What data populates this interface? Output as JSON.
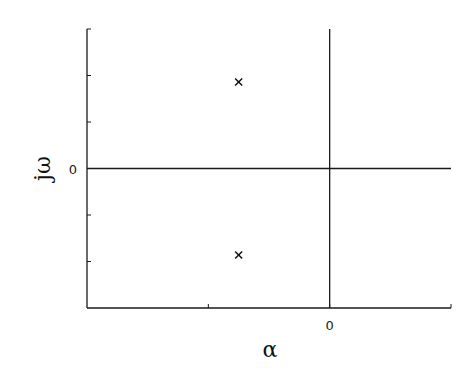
{
  "chart_data": {
    "type": "scatter",
    "title": "",
    "xlabel": "α",
    "ylabel": "jω",
    "xlim": [
      -2,
      1
    ],
    "ylim": [
      -1.5,
      1.5
    ],
    "x_tick_labels": [
      {
        "value": 0,
        "label": "0"
      }
    ],
    "y_tick_labels": [
      {
        "value": 0,
        "label": "0"
      }
    ],
    "x_ticks": [
      -1,
      0
    ],
    "y_ticks": [
      -1,
      -0.5,
      0.5,
      1
    ],
    "grid": false,
    "reference_lines": {
      "horizontal_at": 0,
      "vertical_at": 0
    },
    "series": [
      {
        "name": "poles",
        "marker": "x",
        "points": [
          {
            "x": -0.75,
            "y": 0.93
          },
          {
            "x": -0.75,
            "y": -0.93
          }
        ]
      }
    ]
  }
}
